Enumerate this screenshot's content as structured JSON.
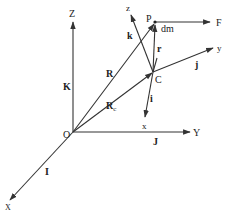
{
  "diagram": {
    "line_color": "#333333",
    "origin_label": "O",
    "global_axes": {
      "Z": "Z",
      "Y": "Y",
      "X": "X",
      "K": "K",
      "J": "J",
      "I": "I"
    },
    "body_frame": {
      "point_C": "C",
      "z": "z",
      "y": "y",
      "x": "x",
      "k": "k",
      "j": "j",
      "i": "i"
    },
    "vectors": {
      "R": "R",
      "R_c": "R",
      "R_c_sub": "c",
      "r": "r"
    },
    "particle": {
      "point_P": "P",
      "mass": "dm",
      "force": "F"
    }
  }
}
